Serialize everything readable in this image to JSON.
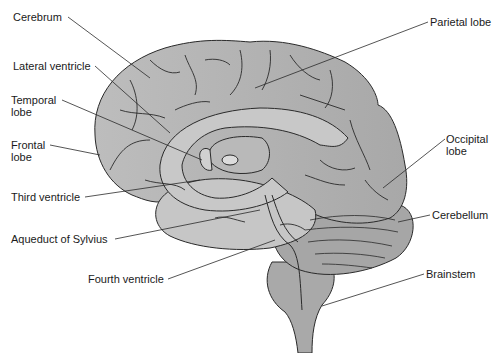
{
  "diagram": {
    "colors": {
      "background": "#ffffff",
      "brain_fill": "#b7b7b7",
      "brain_fill_light": "#c9c9c9",
      "stem_fill": "#a9a9a9",
      "outline": "#2a2a2a",
      "label_text": "#1a1a1a"
    },
    "labels": [
      {
        "id": "cerebrum",
        "text": "Cerebrum",
        "x": 13,
        "y": 11
      },
      {
        "id": "lateral-ventricle",
        "text": "Lateral ventricle",
        "x": 13,
        "y": 60
      },
      {
        "id": "temporal-lobe",
        "text": "Temporal\nlobe",
        "x": 11,
        "y": 94
      },
      {
        "id": "frontal-lobe",
        "text": "Frontal\nlobe",
        "x": 11,
        "y": 139
      },
      {
        "id": "third-ventricle",
        "text": "Third ventricle",
        "x": 11,
        "y": 191
      },
      {
        "id": "aqueduct-of-sylvius",
        "text": "Aqueduct of Sylvius",
        "x": 11,
        "y": 233
      },
      {
        "id": "fourth-ventricle",
        "text": "Fourth ventricle",
        "x": 88,
        "y": 273
      },
      {
        "id": "parietal-lobe",
        "text": "Parietal lobe",
        "x": 430,
        "y": 16
      },
      {
        "id": "occipital-lobe",
        "text": "Occipital\nlobe",
        "x": 446,
        "y": 133
      },
      {
        "id": "cerebellum",
        "text": "Cerebellum",
        "x": 432,
        "y": 209
      },
      {
        "id": "brainstem",
        "text": "Brainstem",
        "x": 426,
        "y": 268
      }
    ]
  }
}
